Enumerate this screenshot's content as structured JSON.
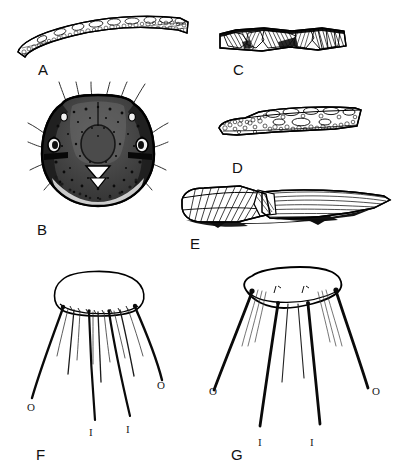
{
  "plate": {
    "width": 400,
    "height": 476,
    "background_color": "#ffffff",
    "ink_color": "#000000",
    "style": "scientific line illustration plate"
  },
  "panels": [
    {
      "id": "A",
      "letter": "A",
      "subject": "elongate curved sclerite with reticulate cellular surface texture",
      "letter_x": 38,
      "letter_y": 62
    },
    {
      "id": "B",
      "letter": "B",
      "subject": "head capsule in dorsal view, heavily punctate, with ocelli and pale triangular labrum, bearing long setae",
      "letter_x": 37,
      "letter_y": 222
    },
    {
      "id": "C",
      "letter": "C",
      "subject": "narrow banded sclerite with oblique striate and hatched shading",
      "letter_x": 233,
      "letter_y": 62
    },
    {
      "id": "D",
      "letter": "D",
      "subject": "tapered sclerite with coarse vesicular cell pattern",
      "letter_x": 232,
      "letter_y": 160
    },
    {
      "id": "E",
      "letter": "E",
      "subject": "wing or tegmen with longitudinal striations and overlapping dark basal region",
      "letter_x": 190,
      "letter_y": 236
    },
    {
      "id": "F",
      "letter": "F",
      "subject": "rounded oval plate with radiating marginal setae, outer and inner setae labelled",
      "letter_x": 36,
      "letter_y": 455
    },
    {
      "id": "G",
      "letter": "G",
      "subject": "flattened trapezoidal plate with radiating marginal setae, outer and inner setae labelled",
      "letter_x": 231,
      "letter_y": 455
    }
  ],
  "seta_labels": {
    "outer": "O",
    "inner": "I",
    "figure_f": [
      {
        "text": "O",
        "x": 27,
        "y": 408
      },
      {
        "text": "O",
        "x": 156,
        "y": 385
      },
      {
        "text": "I",
        "x": 88,
        "y": 434
      },
      {
        "text": "I",
        "x": 125,
        "y": 431
      }
    ],
    "figure_g": [
      {
        "text": "O",
        "x": 209,
        "y": 392
      },
      {
        "text": "O",
        "x": 371,
        "y": 392
      },
      {
        "text": "I",
        "x": 258,
        "y": 443
      },
      {
        "text": "I",
        "x": 309,
        "y": 443
      }
    ]
  }
}
